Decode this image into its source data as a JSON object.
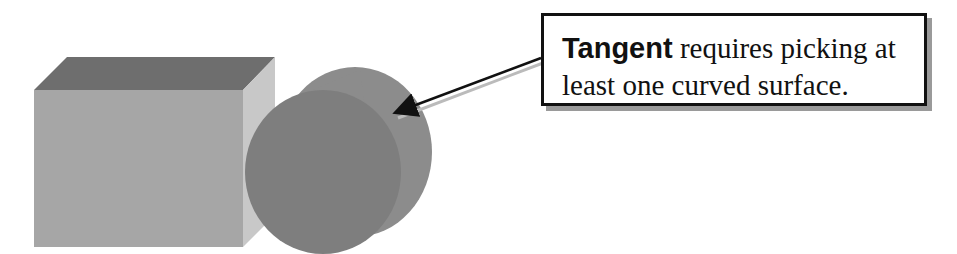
{
  "callout": {
    "keyword": "Tangent",
    "line1_rest": " requires picking at",
    "line2": "least one curved surface."
  },
  "shapes": {
    "box": {
      "front": "#a6a6a6",
      "top": "#6e6e6e",
      "side": "#c8c8c8"
    },
    "cylinder": {
      "body": "#8a8a8a",
      "face": "#7c7c7c"
    }
  }
}
